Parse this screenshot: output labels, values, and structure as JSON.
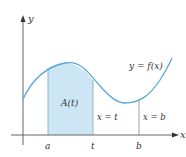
{
  "figure": {
    "y_axis_label": "y",
    "x_axis_label": "x",
    "curve_label": "y = f(x)",
    "area_label": "A(t)",
    "tick_labels": {
      "a": "a",
      "t": "t",
      "b": "b"
    },
    "line_labels": {
      "t": "x = t",
      "b": "x = b"
    },
    "colors": {
      "curve": "#5aa9d6",
      "fill": "#cde6f5",
      "axis": "#555555",
      "text": "#333333"
    }
  }
}
